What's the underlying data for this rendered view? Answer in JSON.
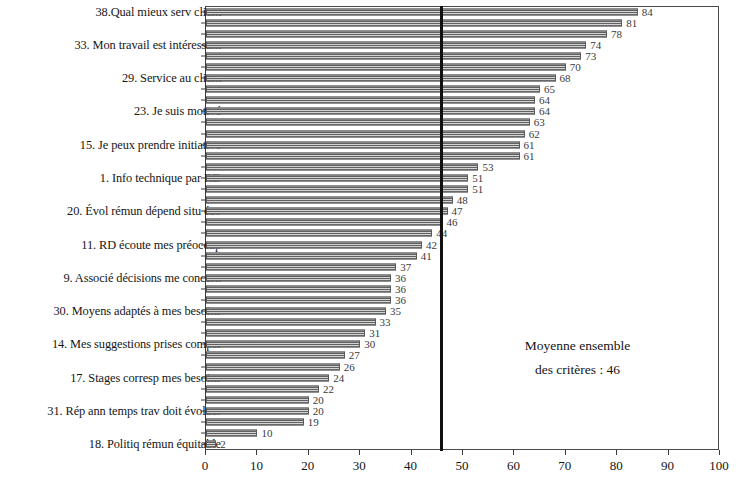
{
  "chart_data": {
    "type": "bar",
    "orientation": "horizontal",
    "title": "",
    "subtitle": "",
    "xlabel": "",
    "ylabel": "",
    "xlim": [
      0,
      100
    ],
    "xticks": [
      0,
      10,
      20,
      30,
      40,
      50,
      60,
      70,
      80,
      90,
      100
    ],
    "grid": false,
    "legend": null,
    "bar_color": "#8d8d8d",
    "bar_edge_color": "#5a5a5a",
    "annotation_line": {
      "name": "mean-line",
      "value": 46,
      "color": "#111111",
      "orientation": "vertical"
    },
    "annotation_text": {
      "line1": "Moyenne ensemble",
      "line2": "des critères : 46"
    },
    "categories": [
      "38.Qual mieux serv client",
      "",
      "",
      "33. Mon travail est intéressant",
      "",
      "",
      "29. Service au client",
      "",
      "",
      "23. Je suis motivé",
      "",
      "",
      "15. Je peux prendre initiative",
      "",
      "",
      "1. Info technique par RD",
      "",
      "",
      "20. Évol rémun dépend situ éco",
      "",
      "",
      "11. RD écoute mes préoccup",
      "",
      "",
      "9. Associé décisions me concern",
      "",
      "",
      "30. Moyens adaptés à mes besoins",
      "",
      "",
      "14. Mes suggestions prises compte",
      "",
      "",
      "17. Stages corresp mes besoins",
      "",
      "",
      "31. Rép ann temps trav doit évoluer",
      "",
      "",
      "18. Politiq rémun équitable"
    ],
    "values": [
      84,
      81,
      78,
      74,
      73,
      70,
      68,
      65,
      64,
      64,
      63,
      62,
      61,
      61,
      53,
      51,
      51,
      48,
      47,
      46,
      44,
      42,
      41,
      37,
      36,
      36,
      36,
      35,
      33,
      31,
      30,
      27,
      26,
      24,
      22,
      20,
      20,
      19,
      10,
      2
    ]
  }
}
